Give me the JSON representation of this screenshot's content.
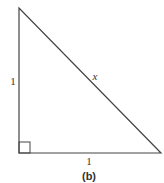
{
  "figure": {
    "caption": "(b)",
    "stroke_color": "#444444",
    "vertices": {
      "top": [
        19,
        8
      ],
      "bottom_left": [
        19,
        153
      ],
      "bottom_right": [
        161,
        153
      ]
    },
    "right_angle_marker": {
      "x": 19,
      "y": 142,
      "size": 11
    },
    "labels": {
      "left_side": "1",
      "bottom_side": "1",
      "hypotenuse": "x"
    }
  }
}
